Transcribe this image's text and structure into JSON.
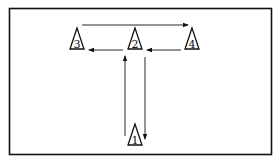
{
  "diagram": {
    "type": "T-drill cone layout",
    "colors": {
      "line": "#111111",
      "background": "#ffffff"
    },
    "cones": [
      {
        "id": "cone-1",
        "label": "1",
        "x": 135,
        "y": 145
      },
      {
        "id": "cone-2",
        "label": "2",
        "x": 135,
        "y": 50
      },
      {
        "id": "cone-3",
        "label": "3",
        "x": 77,
        "y": 50
      },
      {
        "id": "cone-4",
        "label": "4",
        "x": 192,
        "y": 50
      }
    ],
    "arrows": [
      {
        "from": "1",
        "to": "2",
        "direction": "up"
      },
      {
        "from": "2",
        "to": "3",
        "direction": "left"
      },
      {
        "from": "3",
        "to": "4",
        "direction": "right"
      },
      {
        "from": "4",
        "to": "2",
        "direction": "left"
      },
      {
        "from": "2",
        "to": "1",
        "direction": "down"
      }
    ]
  }
}
